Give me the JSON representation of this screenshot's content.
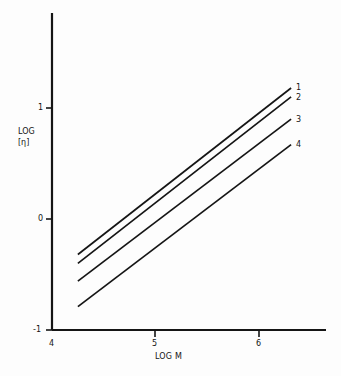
{
  "chart_data": {
    "type": "line",
    "title": "",
    "subtitle": "",
    "xlabel": "LOG M",
    "ylabel_line1": "LOG",
    "ylabel_line2": "[η]",
    "xlim": [
      4,
      6.6
    ],
    "ylim": [
      -1,
      1.45
    ],
    "xticks": [
      4,
      5,
      6
    ],
    "xtick_labels": [
      "4",
      "5",
      "6"
    ],
    "yticks": [
      -1,
      0,
      1
    ],
    "ytick_labels": [
      "-1",
      "0",
      "1"
    ],
    "grid": false,
    "legend_position": "right-end-of-line",
    "annotations": [
      "1",
      "2",
      "3",
      "4"
    ],
    "x": [
      4.25,
      6.31
    ],
    "series": [
      {
        "name": "1",
        "label": "1",
        "values": [
          -0.32,
          1.18
        ],
        "slope": 0.728,
        "color": "#151515"
      },
      {
        "name": "2",
        "label": "2",
        "values": [
          -0.4,
          1.1
        ],
        "slope": 0.728,
        "color": "#151515"
      },
      {
        "name": "3",
        "label": "3",
        "values": [
          -0.56,
          0.9
        ],
        "slope": 0.709,
        "color": "#151515"
      },
      {
        "name": "4",
        "label": "4",
        "values": [
          -0.79,
          0.67
        ],
        "slope": 0.709,
        "color": "#151515"
      }
    ]
  },
  "axes": {
    "x_title": "LOG M",
    "y_title_top": "LOG",
    "y_title_bottom": "[η]",
    "xtick_4": "4",
    "xtick_5": "5",
    "xtick_6": "6",
    "ytick_neg1": "-1",
    "ytick_0": "0",
    "ytick_1": "1"
  },
  "curve_labels": {
    "c1": "1",
    "c2": "2",
    "c3": "3",
    "c4": "4"
  },
  "colors": {
    "axis": "#151515",
    "line": "#151515",
    "background": "#fdfdfd",
    "text": "#141414"
  }
}
